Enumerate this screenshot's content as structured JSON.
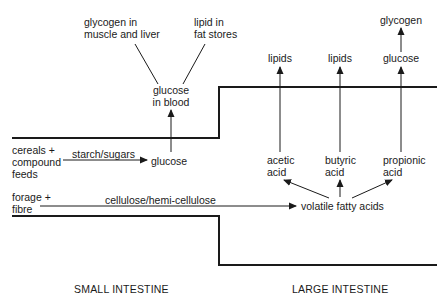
{
  "diagram": {
    "regions": {
      "small_intestine": "SMALL INTESTINE",
      "large_intestine": "LARGE INTESTINE"
    },
    "inputs": {
      "cereals": [
        "cereals +",
        "compound",
        "feeds"
      ],
      "forage": [
        "forage +",
        "fibre"
      ]
    },
    "edges_labels": {
      "starch": "starch/sugars",
      "cellulose": "cellulose/hemi-cellulose"
    },
    "small_intestine_nodes": {
      "glucose": "glucose",
      "glucose_blood": [
        "glucose",
        "in blood"
      ],
      "glycogen_muscle": [
        "glycogen in",
        "muscle and liver"
      ],
      "lipid_fat": [
        "lipid in",
        "fat stores"
      ]
    },
    "large_intestine_nodes": {
      "vfa": "volatile fatty acids",
      "acetic": [
        "acetic",
        "acid"
      ],
      "butyric": [
        "butyric",
        "acid"
      ],
      "propionic": [
        "propionic",
        "acid"
      ],
      "lipids_1": "lipids",
      "lipids_2": "lipids",
      "glucose": "glucose",
      "glycogen": "glycogen"
    },
    "colors": {
      "line": "#1a1a1a",
      "background": "#ffffff"
    }
  }
}
